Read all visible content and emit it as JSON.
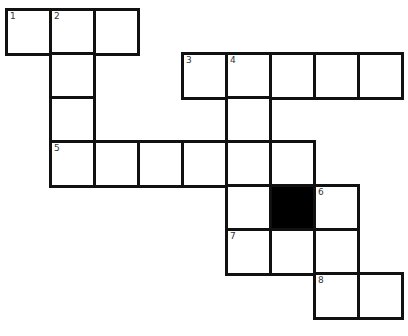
{
  "puzzle": {
    "cell_size": 44,
    "origin": [
      6,
      9
    ],
    "colors": {
      "line": "#111111",
      "fill": "#ffffff",
      "block": "#000000",
      "number": "#333333"
    },
    "cells": [
      {
        "row": 0,
        "col": 0,
        "num": "1"
      },
      {
        "row": 0,
        "col": 1,
        "num": "2"
      },
      {
        "row": 0,
        "col": 2,
        "num": ""
      },
      {
        "row": 1,
        "col": 1,
        "num": ""
      },
      {
        "row": 1,
        "col": 4,
        "num": "3"
      },
      {
        "row": 1,
        "col": 5,
        "num": "4"
      },
      {
        "row": 1,
        "col": 6,
        "num": ""
      },
      {
        "row": 1,
        "col": 7,
        "num": ""
      },
      {
        "row": 1,
        "col": 8,
        "num": ""
      },
      {
        "row": 2,
        "col": 1,
        "num": ""
      },
      {
        "row": 2,
        "col": 5,
        "num": ""
      },
      {
        "row": 3,
        "col": 1,
        "num": "5"
      },
      {
        "row": 3,
        "col": 2,
        "num": ""
      },
      {
        "row": 3,
        "col": 3,
        "num": ""
      },
      {
        "row": 3,
        "col": 4,
        "num": ""
      },
      {
        "row": 3,
        "col": 5,
        "num": ""
      },
      {
        "row": 3,
        "col": 6,
        "num": ""
      },
      {
        "row": 4,
        "col": 5,
        "num": ""
      },
      {
        "row": 4,
        "col": 6,
        "num": "",
        "block": true
      },
      {
        "row": 4,
        "col": 7,
        "num": "6"
      },
      {
        "row": 5,
        "col": 5,
        "num": "7"
      },
      {
        "row": 5,
        "col": 6,
        "num": ""
      },
      {
        "row": 5,
        "col": 7,
        "num": ""
      },
      {
        "row": 6,
        "col": 7,
        "num": "8"
      },
      {
        "row": 6,
        "col": 8,
        "num": ""
      }
    ],
    "clue_numbers": [
      "1",
      "2",
      "3",
      "4",
      "5",
      "6",
      "7",
      "8"
    ]
  }
}
